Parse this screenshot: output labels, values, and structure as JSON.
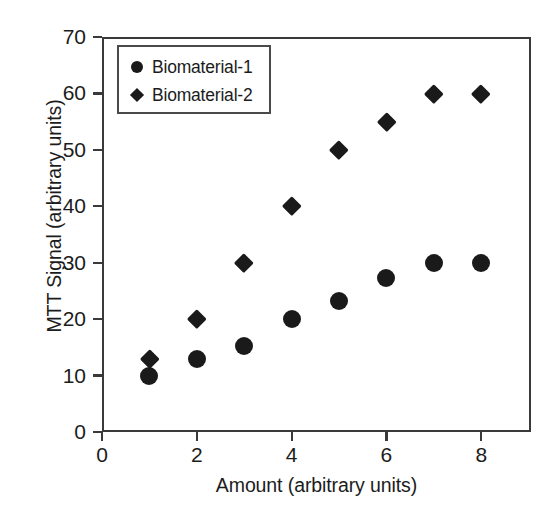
{
  "chart_data": {
    "type": "scatter",
    "title": "",
    "xlabel": "Amount (arbitrary units)",
    "ylabel": "MTT Signal (arbitrary units)",
    "xlim": [
      0,
      9.05
    ],
    "ylim": [
      0,
      70
    ],
    "xticks": [
      0,
      2,
      4,
      6,
      8
    ],
    "xtick_labels": [
      "0",
      "2",
      "4",
      "6",
      "8"
    ],
    "yticks": [
      0,
      10,
      20,
      30,
      40,
      50,
      60,
      70
    ],
    "ytick_labels": [
      "0",
      "10",
      "20",
      "30",
      "40",
      "50",
      "60",
      "70"
    ],
    "grid": false,
    "legend_position": "upper left",
    "marker_color": "#1a1a1a",
    "series": [
      {
        "name": "Biomaterial-1",
        "marker": "circle",
        "x": [
          1,
          2,
          3,
          4,
          5,
          6,
          7,
          8
        ],
        "values": [
          10,
          13,
          15.3,
          20,
          23.3,
          27.3,
          30,
          30
        ]
      },
      {
        "name": "Biomaterial-2",
        "marker": "diamond",
        "x": [
          1,
          2,
          3,
          4,
          5,
          6,
          7,
          8
        ],
        "values": [
          13,
          20,
          30,
          40,
          50,
          55,
          60,
          60
        ]
      }
    ]
  },
  "legend": {
    "entries": [
      {
        "label": "Biomaterial-1",
        "marker": "circle"
      },
      {
        "label": "Biomaterial-2",
        "marker": "diamond"
      }
    ]
  }
}
